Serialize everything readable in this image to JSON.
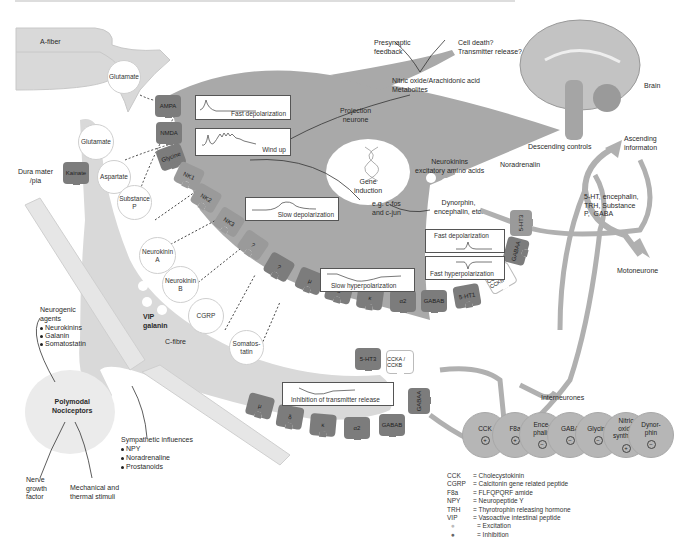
{
  "figure": {
    "colors": {
      "background": "#ffffff",
      "neurone_fill": "#a9a9a9",
      "fibre_fill": "#d9d9d9",
      "receptor_light": "#9a9a9a",
      "receptor_dark": "#7c7c7c",
      "interneurone_fill": "#b6b6b6",
      "descending_path": "#b0b0b0"
    }
  },
  "fibres": {
    "a_fiber": "A-fiber",
    "c_fibre": "C-fibre",
    "dura_mater": "Dura mater\n/pia"
  },
  "vesicles": {
    "a_glutamate": "Glutamate",
    "c_glutamate": "Glutamate",
    "aspartate": "Aspartate",
    "substance_p": "Substance\nP",
    "neurokinin_a": "Neurokinin\nA",
    "neurokinin_b": "Neurokinin\nB",
    "cgrp": "CGRP",
    "vip_galanin": "VIP\ngalanin",
    "somatostatin": "Somatos-\ntatin"
  },
  "postsynaptic_receptors": [
    "AMPA",
    "NMDA",
    "Glycine",
    "NK1",
    "NK2",
    "NK3",
    "?",
    "?",
    "μ",
    "δ",
    "κ",
    "α2",
    "GABAB",
    "5-HT1",
    "CCKA / CCKB",
    "GABAA",
    "5-HT3"
  ],
  "presynaptic_receptors": [
    "Kainate",
    "5-HT3",
    "CCKA / CCKB",
    "μ",
    "δ",
    "κ",
    "α2",
    "GABAB",
    "GABAA"
  ],
  "traces": {
    "fast_depol_1": "Fast depolarization",
    "wind_up": "Wind up",
    "slow_depol": "Slow depolarization",
    "slow_hyper": "Slow hyperpolarization",
    "fast_depol_2": "Fast depolarization",
    "fast_hyper": "Fast hyperpolarization",
    "inhibition": "Inhibition of transmitter release"
  },
  "neurone": {
    "projection": "Projection\nneurone",
    "gene_induction": "Gene\ninduction",
    "cfos": "e.g. c-fos\nand c-jun",
    "dynorphin": "Dynorphin,\nencephalin, etc.",
    "neurokinins": "Neurokinins\nexcitatory amino acids"
  },
  "top_text": {
    "nitric_oxide": "Nitric oxide/Arachidonic acid\nMetabolites",
    "presynaptic_feedback": "Presynaptic\nfeedback",
    "cell_death": "Cell death?\nTransmitter release?"
  },
  "brain": {
    "label": "Brain",
    "descending": "Descending controls",
    "ascending": "Ascending\ninformaton",
    "noradrenalin": "Noradrenalin",
    "mediators": "5-HT, encephalin,\nTRH, Substance\nP,  GABA",
    "motoneurone": "Motoneurone"
  },
  "periphery": {
    "neurogenic_title": "Neurogenic\nagents",
    "neurogenic_items": [
      "Neurokinins",
      "Galanin",
      "Somatostatin"
    ],
    "polymodal": "Polymodal\nNociceptors",
    "sympathetic_title": "Sympathetic influences",
    "sympathetic_items": [
      "NPY",
      "Noradrenaline",
      "Prostanoids"
    ],
    "ngf": "Nerve\ngrowth\nfactor",
    "mechanical": "Mechanical and\nthermal stimuli"
  },
  "interneurones": {
    "label": "Interneurones",
    "cells": [
      {
        "name": "CCK",
        "sign": "+"
      },
      {
        "name": "F8a",
        "sign": "+"
      },
      {
        "name": "Ence-\nphalin",
        "sign": "−"
      },
      {
        "name": "GABA",
        "sign": "−"
      },
      {
        "name": "Glycine",
        "sign": "−"
      },
      {
        "name": "Nitric\noxide\nsynthase",
        "sign": "+"
      },
      {
        "name": "Dynor-\nphin",
        "sign": "−"
      }
    ]
  },
  "legend": [
    {
      "key": "CCK",
      "value": "= Cholecystokinin"
    },
    {
      "key": "CGRP",
      "value": "= Calcitonin gene related peptide"
    },
    {
      "key": "F8a",
      "value": "= FLFQPQRF amide"
    },
    {
      "key": "NPY",
      "value": "= Neuropeptide Y"
    },
    {
      "key": "TRH",
      "value": "= Thyrotrophin  releasing hormone"
    },
    {
      "key": "VIP",
      "value": "= Vasoactive intestinal peptide"
    },
    {
      "key": "●",
      "value": "= Excitation"
    },
    {
      "key": "●",
      "value": "= Inhibition"
    }
  ]
}
